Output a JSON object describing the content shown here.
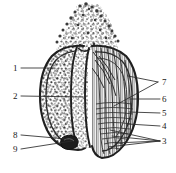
{
  "figure": {
    "style": "black ink stipple and hatch line drawing on white background",
    "background_color": "#ffffff",
    "ink_color": "#1a1a1a",
    "leader_line_color": "#2b2b2b"
  },
  "labels": [
    {
      "id": "1",
      "text": "1",
      "x": 13,
      "y": 64,
      "side": "left",
      "leader": {
        "from_x": 21,
        "from_y": 68,
        "to_x": 55,
        "to_y": 68
      }
    },
    {
      "id": "2",
      "text": "2",
      "x": 13,
      "y": 92,
      "side": "left",
      "leader": {
        "from_x": 21,
        "from_y": 96,
        "to_x": 83,
        "to_y": 97
      }
    },
    {
      "id": "3",
      "text": "3",
      "x": 162,
      "y": 137,
      "side": "right",
      "leader": {
        "from_x": 160,
        "from_y": 141,
        "to_x": 112,
        "to_y": 136
      }
    },
    {
      "id": "4",
      "text": "4",
      "x": 162,
      "y": 122,
      "side": "right",
      "leader": {
        "from_x": 160,
        "from_y": 126,
        "to_x": 128,
        "to_y": 124
      }
    },
    {
      "id": "5",
      "text": "5",
      "x": 162,
      "y": 109,
      "side": "right",
      "leader": {
        "from_x": 160,
        "from_y": 113,
        "to_x": 129,
        "to_y": 112
      }
    },
    {
      "id": "6",
      "text": "6",
      "x": 162,
      "y": 95,
      "side": "right",
      "leader": {
        "from_x": 160,
        "from_y": 99,
        "to_x": 130,
        "to_y": 99
      }
    },
    {
      "id": "7",
      "text": "7",
      "x": 162,
      "y": 78,
      "side": "right",
      "leader": {
        "from_x": 158,
        "from_y": 82,
        "to_x": 128,
        "to_y": 76
      }
    },
    {
      "id": "8",
      "text": "8",
      "x": 13,
      "y": 131,
      "side": "left",
      "leader": {
        "from_x": 21,
        "from_y": 135,
        "to_x": 67,
        "to_y": 139
      }
    },
    {
      "id": "9",
      "text": "9",
      "x": 13,
      "y": 145,
      "side": "left",
      "leader": {
        "from_x": 21,
        "from_y": 149,
        "to_x": 72,
        "to_y": 140
      }
    }
  ],
  "leader_fan_3": [
    {
      "from_x": 160,
      "from_y": 141,
      "to_x": 110,
      "to_y": 130
    },
    {
      "from_x": 160,
      "from_y": 141,
      "to_x": 112,
      "to_y": 136
    },
    {
      "from_x": 160,
      "from_y": 141,
      "to_x": 115,
      "to_y": 143
    },
    {
      "from_x": 160,
      "from_y": 141,
      "to_x": 108,
      "to_y": 147
    }
  ],
  "leader_fan_7": [
    {
      "from_x": 158,
      "from_y": 82,
      "to_x": 128,
      "to_y": 76
    },
    {
      "from_x": 158,
      "from_y": 82,
      "to_x": 114,
      "to_y": 106
    }
  ],
  "parts": {
    "apex": "stippled apical mass",
    "left_lobe": "mottled stippled lobe",
    "right_lobe": "longitudinally striated lobe",
    "basal_spot": "dark basal body"
  }
}
